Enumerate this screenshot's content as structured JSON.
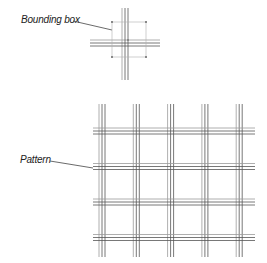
{
  "labels": {
    "bounding_box": "Bounding box",
    "pattern": "Pattern"
  },
  "colors": {
    "line_dark": "#555555",
    "line_light": "#9a9a9a",
    "bbox_stroke": "#b0b0b0",
    "handle": "#888888",
    "leader": "#444444"
  },
  "tile": {
    "vertical_lines_per_group": 3,
    "horizontal_lines_per_group": 3
  },
  "pattern": {
    "columns": 5,
    "rows": 4
  }
}
